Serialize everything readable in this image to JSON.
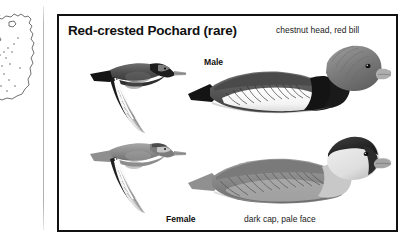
{
  "page": {
    "background_color": "#ffffff",
    "border_color": "#111111"
  },
  "map": {
    "name": "distribution-map-fragment",
    "description": "partial outline map with stippled range dots, cropped at left edge",
    "outline_color": "#2a2a2a"
  },
  "plate": {
    "title": "Red-crested Pochard (rare)",
    "annotations": {
      "male_note": "chestnut head, red bill",
      "female_note": "dark cap, pale face"
    },
    "labels": {
      "male": "Male",
      "female": "Female"
    },
    "figures": [
      {
        "name": "flying-male",
        "caption": "Male in flight, upper left",
        "tones": {
          "back": "#4a4a4a",
          "wing_stripe": "#ffffff",
          "head": "#2b2b2b",
          "bill": "#9a9a9a"
        }
      },
      {
        "name": "flying-female",
        "caption": "Female in flight, lower left",
        "tones": {
          "back": "#8d8d8d",
          "wing_stripe": "#ffffff",
          "head": "#7b7b7b",
          "bill": "#9a9a9a"
        }
      },
      {
        "name": "swimming-male",
        "caption": "Male swimming, upper right",
        "tones": {
          "head": "#7d7d7d",
          "breast": "#161616",
          "flank": "#fbfbfb",
          "back": "#5a5a5a",
          "bill": "#a9a9a9"
        }
      },
      {
        "name": "swimming-female",
        "caption": "Female swimming, lower right",
        "tones": {
          "cap": "#2a2a2a",
          "face": "#e2e2e2",
          "body": "#8a8a8a",
          "bill": "#a0a0a0"
        }
      }
    ]
  }
}
